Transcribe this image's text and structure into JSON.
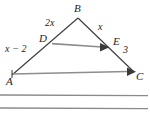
{
  "figure": {
    "type": "geometry-diagram",
    "background_color": "#ffffff",
    "stroke_color": "#3a3a3a",
    "ruled_line_color": "#8a8a8a",
    "vertices": [
      {
        "name": "A",
        "label": "A",
        "x": 12,
        "y": 75
      },
      {
        "name": "B",
        "label": "B",
        "x": 78,
        "y": 18
      },
      {
        "name": "C",
        "label": "C",
        "x": 134,
        "y": 72
      },
      {
        "name": "D",
        "label": "D",
        "x": 52,
        "y": 43
      },
      {
        "name": "E",
        "label": "E",
        "x": 108,
        "y": 50
      }
    ],
    "segment_labels": [
      {
        "name": "BD",
        "label": "2x",
        "x": 46,
        "y": 20
      },
      {
        "name": "BE",
        "label": "x",
        "x": 99,
        "y": 24
      },
      {
        "name": "AD",
        "label": "x − 2",
        "x": 6,
        "y": 45
      },
      {
        "name": "EC",
        "label": "3",
        "x": 123,
        "y": 46
      }
    ],
    "point_labels": [
      {
        "name": "A",
        "label": "A",
        "x": 6,
        "y": 77
      },
      {
        "name": "B",
        "label": "B",
        "x": 74,
        "y": 4
      },
      {
        "name": "C",
        "label": "C",
        "x": 137,
        "y": 72
      },
      {
        "name": "D",
        "label": "D",
        "x": 40,
        "y": 35
      },
      {
        "name": "E",
        "label": "E",
        "x": 113,
        "y": 38
      }
    ],
    "arrows": [
      {
        "name": "de-arrow",
        "at": "E",
        "direction": "right"
      },
      {
        "name": "ac-arrow",
        "at": "C",
        "direction": "right"
      }
    ],
    "ruled_lines": [
      {
        "name": "ruled-line-1",
        "y": 95
      },
      {
        "name": "ruled-line-2",
        "y": 108
      }
    ]
  }
}
